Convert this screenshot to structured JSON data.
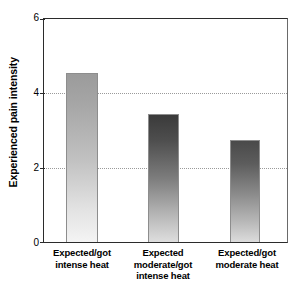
{
  "chart_data": {
    "type": "bar",
    "title": "",
    "subtitle": "",
    "xlabel": "",
    "ylabel": "Experienced pain intensity",
    "ylim": [
      0,
      6
    ],
    "yticks": [
      0,
      2,
      4,
      6
    ],
    "ytick_labels": [
      "0",
      "2",
      "4",
      "6"
    ],
    "gridlines": [
      2,
      4
    ],
    "grid": "horizontal-dotted",
    "legend": "none",
    "categories": [
      "Expected/got intense heat",
      "Expected moderate/got intense heat",
      "Expected/got moderate heat"
    ],
    "category_lines": [
      [
        "Expected/got",
        "intense heat"
      ],
      [
        "Expected",
        "moderate/got",
        "intense heat"
      ],
      [
        "Expected/got",
        "moderate heat"
      ]
    ],
    "values": [
      4.55,
      3.45,
      2.75
    ],
    "bar_styles": [
      {
        "name": "bar-light-gradient",
        "top": "#9b9b9b",
        "bottom": "#f4f4f4"
      },
      {
        "name": "bar-dark-gradient",
        "top": "#3a3a3a",
        "bottom": "#dedede"
      },
      {
        "name": "bar-mid-gradient",
        "top": "#4a4a4a",
        "bottom": "#dcdcdc"
      }
    ]
  },
  "colors": {
    "background": "#ffffff",
    "axis": "#2b2b2b",
    "gridline": "#9a9a9a",
    "text": "#000000"
  }
}
